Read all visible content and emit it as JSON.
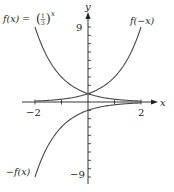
{
  "chart_data": {
    "type": "line",
    "title": "",
    "xlabel": "x",
    "ylabel": "y",
    "xlim": [
      -2,
      2
    ],
    "ylim": [
      -9,
      9
    ],
    "x_ticks": [
      -2,
      -1,
      0,
      1,
      2
    ],
    "x_tick_labels": [
      "-2",
      "2"
    ],
    "y_tick_labels": [
      "9",
      "-9"
    ],
    "grid": false,
    "legend": "inline annotations",
    "series": [
      {
        "name": "f(x) = (1/3)^x",
        "x": [
          -2,
          -1.5,
          -1,
          -0.5,
          0,
          0.5,
          1,
          1.5,
          2
        ],
        "values": [
          9,
          5.196,
          3,
          1.732,
          1,
          0.577,
          0.333,
          0.192,
          0.111
        ]
      },
      {
        "name": "f(-x)",
        "x": [
          -2,
          -1.5,
          -1,
          -0.5,
          0,
          0.5,
          1,
          1.5,
          2
        ],
        "values": [
          0.111,
          0.192,
          0.333,
          0.577,
          1,
          1.732,
          3,
          5.196,
          9
        ]
      },
      {
        "name": "-f(x)",
        "x": [
          -2,
          -1.5,
          -1,
          -0.5,
          0,
          0.5,
          1,
          1.5,
          2
        ],
        "values": [
          -9,
          -5.196,
          -3,
          -1.732,
          -1,
          -0.577,
          -0.333,
          -0.192,
          -0.111
        ]
      }
    ],
    "annotations": [
      "f(x) = (1/3)^x",
      "f(−x)",
      "−f(x)"
    ]
  },
  "labels": {
    "f_label_prefix": "f(x) = ",
    "f_label_num": "1",
    "f_label_den": "3",
    "f_label_exp": "x",
    "fneg_label": "f(−x)",
    "negf_label": "−f(x)",
    "x_axis": "x",
    "y_axis": "y",
    "x_min_tick": "−2",
    "x_max_tick": "2",
    "y_max_tick": "9",
    "y_min_tick": "−9"
  },
  "style": {
    "curve_color": "#4a4a4a",
    "axis_color": "#231f20"
  }
}
